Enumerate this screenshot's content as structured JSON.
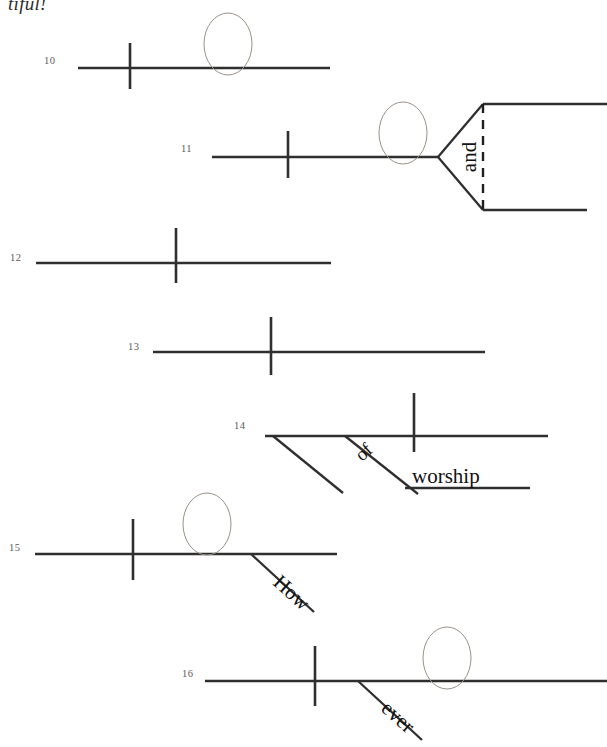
{
  "page": {
    "kind": "sentence-diagramming-worksheet",
    "partial_heading_text": "tiful!",
    "width": 607,
    "height": 747,
    "background_color": "#ffffff",
    "line_color": "#2f2f2f",
    "ellipse_color": "#9a9287",
    "number_color": "#5a5a5a",
    "word_color": "#111111"
  },
  "rows": [
    {
      "number": "10",
      "number_x": 44,
      "number_y": 64,
      "baseline": {
        "x1": 78,
        "y1": 68,
        "x2": 330,
        "y2": 68
      },
      "vbar": {
        "x": 130,
        "y1": 43,
        "y2": 89
      },
      "ellipse": {
        "cx": 228,
        "cy": 44,
        "rx": 24,
        "ry": 31
      },
      "words": [],
      "branches": [],
      "modifiers": []
    },
    {
      "number": "11",
      "number_x": 181,
      "number_y": 152,
      "baseline": {
        "x1": 212,
        "y1": 157,
        "x2": 438,
        "y2": 157
      },
      "vbar": {
        "x": 288,
        "y1": 131,
        "y2": 178
      },
      "ellipse": {
        "cx": 403,
        "cy": 133,
        "rx": 24,
        "ry": 31
      },
      "compound": {
        "apex_x": 438,
        "apex_y": 157,
        "upper": {
          "x": 483,
          "y": 104,
          "x2": 607
        },
        "lower": {
          "x": 483,
          "y": 210,
          "x2": 587
        },
        "dashed": {
          "x": 483,
          "y1": 104,
          "y2": 210
        },
        "conjunction": "and",
        "conjunction_x": 476,
        "conjunction_y": 157
      },
      "words": [],
      "branches": [],
      "modifiers": []
    },
    {
      "number": "12",
      "number_x": 10,
      "number_y": 261,
      "baseline": {
        "x1": 36,
        "y1": 263,
        "x2": 331,
        "y2": 263
      },
      "vbar": {
        "x": 176,
        "y1": 228,
        "y2": 283
      },
      "ellipse": null,
      "words": [],
      "branches": [],
      "modifiers": []
    },
    {
      "number": "13",
      "number_x": 128,
      "number_y": 350,
      "baseline": {
        "x1": 153,
        "y1": 352,
        "x2": 485,
        "y2": 352
      },
      "vbar": {
        "x": 271,
        "y1": 317,
        "y2": 375
      },
      "ellipse": null,
      "words": [],
      "branches": [],
      "modifiers": []
    },
    {
      "number": "14",
      "number_x": 234,
      "number_y": 429,
      "baseline": {
        "x1": 265,
        "y1": 436,
        "x2": 548,
        "y2": 436
      },
      "vbar": {
        "x": 414,
        "y1": 393,
        "y2": 452
      },
      "ellipse": null,
      "words": [
        {
          "text": "of",
          "x": 362,
          "y": 462,
          "rotate": -42,
          "size": "small"
        },
        {
          "text": "worship",
          "x": 412,
          "y": 483,
          "rotate": 0,
          "size": "normal"
        }
      ],
      "modifiers": [
        {
          "x1": 273,
          "y1": 436,
          "x2": 343,
          "y2": 493
        },
        {
          "x1": 345,
          "y1": 436,
          "x2": 418,
          "y2": 494
        }
      ],
      "sublines": [
        {
          "x1": 405,
          "y1": 488,
          "x2": 530,
          "y2": 488
        }
      ]
    },
    {
      "number": "15",
      "number_x": 9,
      "number_y": 551,
      "baseline": {
        "x1": 35,
        "y1": 554,
        "x2": 337,
        "y2": 554
      },
      "vbar": {
        "x": 133,
        "y1": 519,
        "y2": 580
      },
      "ellipse": {
        "cx": 207,
        "cy": 524,
        "rx": 24,
        "ry": 31
      },
      "words": [
        {
          "text": "How",
          "x": 272,
          "y": 584,
          "rotate": 42,
          "size": "normal"
        }
      ],
      "modifiers": [
        {
          "x1": 251,
          "y1": 554,
          "x2": 314,
          "y2": 612
        }
      ]
    },
    {
      "number": "16",
      "number_x": 182,
      "number_y": 677,
      "baseline": {
        "x1": 205,
        "y1": 681,
        "x2": 607,
        "y2": 681
      },
      "vbar": {
        "x": 315,
        "y1": 646,
        "y2": 706
      },
      "ellipse": {
        "cx": 447,
        "cy": 658,
        "rx": 24,
        "ry": 31
      },
      "words": [
        {
          "text": "ever",
          "x": 380,
          "y": 710,
          "rotate": 42,
          "size": "normal"
        }
      ],
      "modifiers": [
        {
          "x1": 358,
          "y1": 681,
          "x2": 422,
          "y2": 740
        }
      ]
    }
  ]
}
